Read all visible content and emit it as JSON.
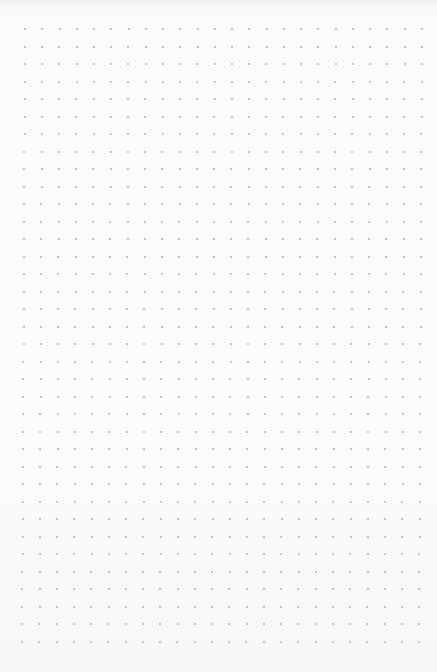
{
  "page": {
    "type": "dot-grid-paper",
    "background_color": "#fbfbfb",
    "dot_color": "#b4b4b4"
  },
  "grid": {
    "columns": 24,
    "rows": 36,
    "origin_x": 25,
    "origin_y": 29,
    "spacing_x": 17.26,
    "spacing_y": 17.5,
    "dot_size": 2
  }
}
